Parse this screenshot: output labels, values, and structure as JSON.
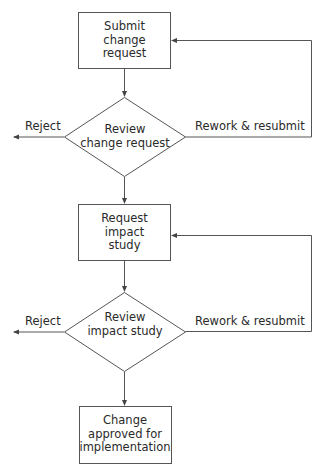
{
  "diagram": {
    "type": "flowchart",
    "nodes": [
      {
        "id": "submit",
        "shape": "rectangle",
        "lines": [
          "Submit",
          "change",
          "request"
        ]
      },
      {
        "id": "review_cr",
        "shape": "diamond",
        "lines": [
          "Review",
          "change request"
        ]
      },
      {
        "id": "request_is",
        "shape": "rectangle",
        "lines": [
          "Request",
          "impact",
          "study"
        ]
      },
      {
        "id": "review_is",
        "shape": "diamond",
        "lines": [
          "Review",
          "impact study"
        ]
      },
      {
        "id": "approved",
        "shape": "rectangle",
        "lines": [
          "Change",
          "approved for",
          "implementation"
        ]
      }
    ],
    "edges": [
      {
        "from": "submit",
        "to": "review_cr",
        "label": ""
      },
      {
        "from": "review_cr",
        "to": "reject_1",
        "label": "Reject"
      },
      {
        "from": "review_cr",
        "to": "submit",
        "label": "Rework & resubmit"
      },
      {
        "from": "review_cr",
        "to": "request_is",
        "label": ""
      },
      {
        "from": "request_is",
        "to": "review_is",
        "label": ""
      },
      {
        "from": "review_is",
        "to": "reject_2",
        "label": "Reject"
      },
      {
        "from": "review_is",
        "to": "request_is",
        "label": "Rework & resubmit"
      },
      {
        "from": "review_is",
        "to": "approved",
        "label": ""
      }
    ],
    "labels": {
      "reject_1": "Reject",
      "rework_1": "Rework & resubmit",
      "reject_2": "Reject",
      "rework_2": "Rework & resubmit"
    },
    "colors": {
      "stroke": "#555555",
      "text": "#2a2a2a",
      "background": "#ffffff"
    }
  }
}
